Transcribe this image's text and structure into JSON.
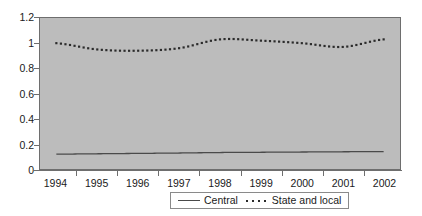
{
  "chart_data": {
    "type": "line",
    "title": "",
    "xlabel": "",
    "ylabel": "",
    "grid": false,
    "legend_position": "bottom",
    "xlim": [
      1993.6,
      2002.4
    ],
    "ylim": [
      0,
      1.2
    ],
    "yticks": [
      "0",
      "0.2",
      "0.4",
      "0.6",
      "0.8",
      "1",
      "1.2"
    ],
    "ytick_values": [
      0,
      0.2,
      0.4,
      0.6,
      0.8,
      1.0,
      1.2
    ],
    "categories": [
      "1994",
      "1995",
      "1996",
      "1997",
      "1998",
      "1999",
      "2000",
      "2001",
      "2002"
    ],
    "x": [
      1994,
      1995,
      1996,
      1997,
      1998,
      1999,
      2000,
      2001,
      2002
    ],
    "series": [
      {
        "name": "Central",
        "style": "solid",
        "color": "#4a4a4a",
        "values": [
          0.118,
          0.121,
          0.124,
          0.127,
          0.131,
          0.133,
          0.135,
          0.137,
          0.138
        ]
      },
      {
        "name": "State and local",
        "style": "dotted",
        "color": "#2b2b2b",
        "values": [
          1.0,
          0.95,
          0.94,
          0.96,
          1.03,
          1.02,
          1.0,
          0.97,
          1.03
        ]
      }
    ]
  },
  "axes": {
    "y_labels": [
      {
        "text": "1.2",
        "value": 1.2
      },
      {
        "text": "1",
        "value": 1.0
      },
      {
        "text": "0.8",
        "value": 0.8
      },
      {
        "text": "0.6",
        "value": 0.6
      },
      {
        "text": "0.4",
        "value": 0.4
      },
      {
        "text": "0.2",
        "value": 0.2
      },
      {
        "text": "0",
        "value": 0.0
      }
    ],
    "x_labels": [
      {
        "text": "1994",
        "value": 1994
      },
      {
        "text": "1995",
        "value": 1995
      },
      {
        "text": "1996",
        "value": 1996
      },
      {
        "text": "1997",
        "value": 1997
      },
      {
        "text": "1998",
        "value": 1998
      },
      {
        "text": "1999",
        "value": 1999
      },
      {
        "text": "2000",
        "value": 2000
      },
      {
        "text": "2001",
        "value": 2001
      },
      {
        "text": "2002",
        "value": 2002
      }
    ]
  },
  "legend": {
    "entries": [
      {
        "label": "Central",
        "style": "solid"
      },
      {
        "label": "State and local",
        "style": "dotted"
      }
    ]
  },
  "colors": {
    "plot_background": "#bcbcbc",
    "page_background": "#ffffff",
    "axis": "#6e6e6e",
    "central_line": "#4a4a4a",
    "state_local_line": "#2b2b2b",
    "text": "#1a1a1a"
  }
}
